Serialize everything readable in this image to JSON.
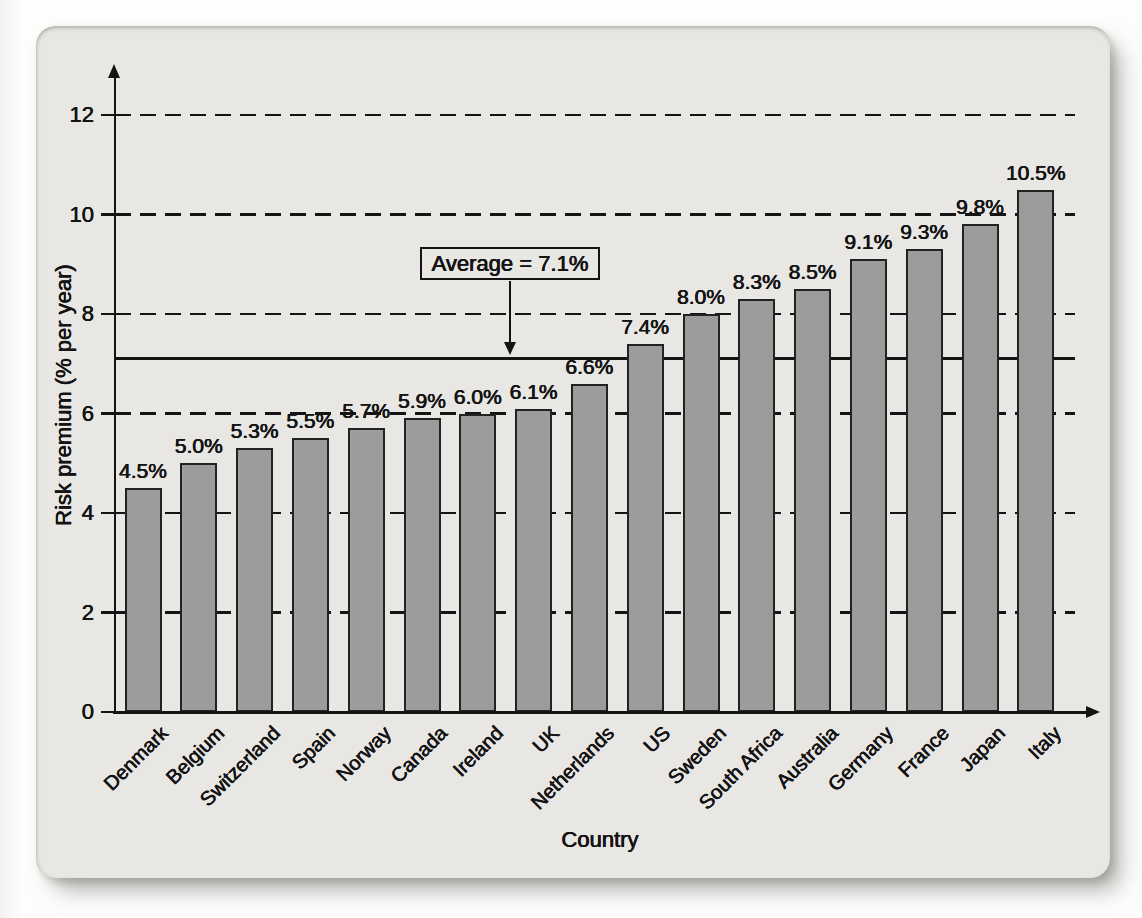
{
  "figure": {
    "page_background": "#fdfdfc",
    "card_background": "#e8e7e4",
    "ink": "#141414",
    "bar_fill": "#9c9c9c",
    "bar_border": "#222222"
  },
  "chart_data": {
    "type": "bar",
    "title": "",
    "xlabel": "Country",
    "ylabel": "Risk premium (% per year)",
    "categories": [
      "Denmark",
      "Belgium",
      "Switzerland",
      "Spain",
      "Norway",
      "Canada",
      "Ireland",
      "UK",
      "Netherlands",
      "US",
      "Sweden",
      "South Africa",
      "Australia",
      "Germany",
      "France",
      "Japan",
      "Italy"
    ],
    "values": [
      4.5,
      5.0,
      5.3,
      5.5,
      5.7,
      5.9,
      6.0,
      6.1,
      6.6,
      7.4,
      8.0,
      8.3,
      8.5,
      9.1,
      9.3,
      9.8,
      10.5
    ],
    "bar_labels": [
      "4.5%",
      "5.0%",
      "5.3%",
      "5.5%",
      "5.7%",
      "5.9%",
      "6.0%",
      "6.1%",
      "6.6%",
      "7.4%",
      "8.0%",
      "8.3%",
      "8.5%",
      "9.1%",
      "9.3%",
      "9.8%",
      "10.5%"
    ],
    "yticks": [
      0,
      2,
      4,
      6,
      8,
      10,
      12
    ],
    "ylim": [
      0,
      12.9
    ],
    "grid": "horizontal dashed lines at y ticks 2-12, drawn behind bars",
    "legend_position": "none",
    "annotation": {
      "label": "Average = 7.1%",
      "value": 7.1
    }
  }
}
